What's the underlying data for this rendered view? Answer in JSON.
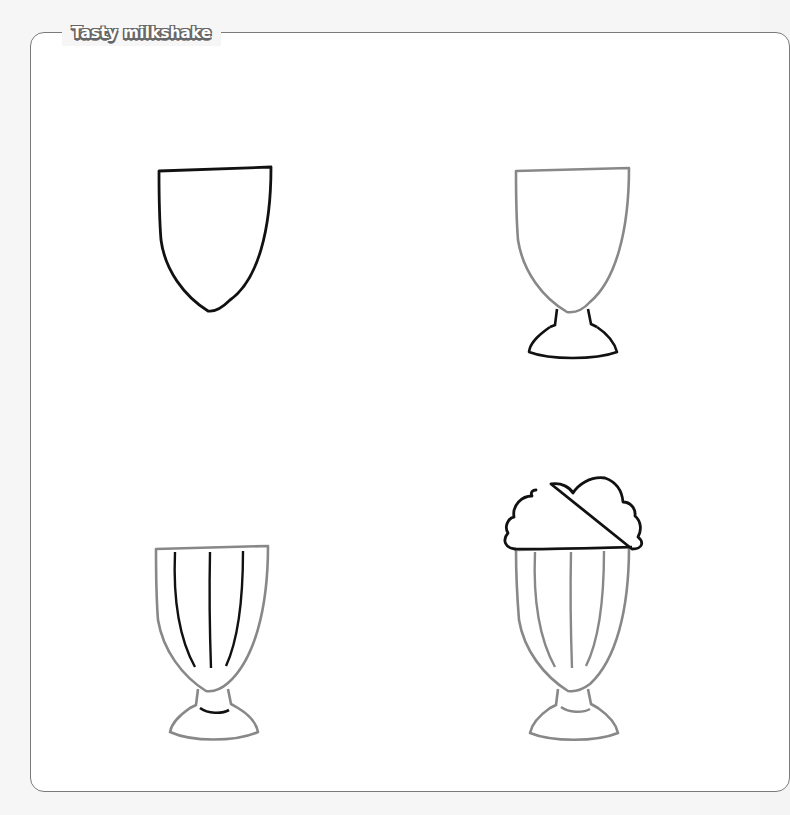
{
  "page": {
    "title": "Tasty milkshake",
    "colors": {
      "background": "#f6f6f6",
      "panel": "#ffffff",
      "frame_border": "#7a7a7a",
      "new_stroke": "#111111",
      "previous_stroke": "#888888"
    }
  },
  "steps": [
    {
      "number": 1,
      "description": "Glass bowl outline",
      "new_parts": [
        "bowl"
      ]
    },
    {
      "number": 2,
      "description": "Add stem and base",
      "new_parts": [
        "stem",
        "base"
      ]
    },
    {
      "number": 3,
      "description": "Add vertical ridges and base curve",
      "new_parts": [
        "ridges",
        "base-curve"
      ]
    },
    {
      "number": 4,
      "description": "Add whipped cream on top",
      "new_parts": [
        "whipped-cream"
      ]
    }
  ]
}
